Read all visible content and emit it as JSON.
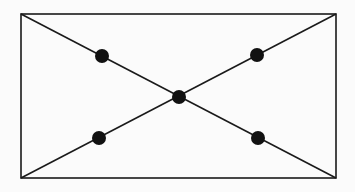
{
  "diagram": {
    "type": "rectangle-with-diagonals",
    "stroke_color": "#1a1a1a",
    "dot_color": "#111111",
    "background": "#fbfbfb",
    "rectangle": {
      "x": 21,
      "y": 14,
      "width": 315,
      "height": 164
    },
    "diagonals": [
      {
        "x1": 21,
        "y1": 14,
        "x2": 336,
        "y2": 178
      },
      {
        "x1": 336,
        "y1": 14,
        "x2": 21,
        "y2": 178
      }
    ],
    "points": [
      {
        "name": "upper-left-point",
        "cx": 102,
        "cy": 56
      },
      {
        "name": "upper-right-point",
        "cx": 257,
        "cy": 55
      },
      {
        "name": "center-point",
        "cx": 179,
        "cy": 97
      },
      {
        "name": "lower-left-point",
        "cx": 99,
        "cy": 138
      },
      {
        "name": "lower-right-point",
        "cx": 258,
        "cy": 138
      }
    ],
    "point_radius": 7
  }
}
